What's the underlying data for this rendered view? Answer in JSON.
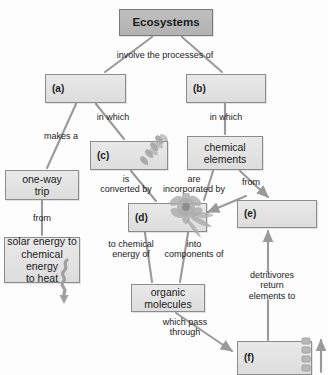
{
  "diagram": {
    "colors": {
      "node_fill": "#e2e2e2",
      "node_fill_dark": "#bfbfbf",
      "node_border": "#8c8c8c",
      "connector": "#9a9a9a",
      "text": "#1b1b1b"
    },
    "nodes": [
      {
        "id": "ecosystems",
        "label": "Ecosystems",
        "style": "dark",
        "x": 119,
        "y": 9,
        "w": 94,
        "h": 27
      },
      {
        "id": "a",
        "label": "(a)",
        "style": "blank",
        "x": 45,
        "y": 74,
        "w": 81,
        "h": 29
      },
      {
        "id": "b",
        "label": "(b)",
        "style": "blank",
        "x": 186,
        "y": 74,
        "w": 80,
        "h": 29
      },
      {
        "id": "c",
        "label": "(c)",
        "style": "blank",
        "x": 90,
        "y": 141,
        "w": 78,
        "h": 29
      },
      {
        "id": "chem",
        "label": "chemical\nelements",
        "style": "plain",
        "x": 187,
        "y": 136,
        "w": 76,
        "h": 34
      },
      {
        "id": "oneway",
        "label": "one-way\ntrip",
        "style": "plain",
        "x": 5,
        "y": 170,
        "w": 74,
        "h": 30
      },
      {
        "id": "d",
        "label": "(d)",
        "style": "blank",
        "x": 128,
        "y": 203,
        "w": 79,
        "h": 29
      },
      {
        "id": "e",
        "label": "(e)",
        "style": "blank",
        "x": 237,
        "y": 200,
        "w": 80,
        "h": 28
      },
      {
        "id": "solar",
        "label": "solar energy to\nchemical energy\nto heat",
        "style": "plain",
        "x": 4,
        "y": 237,
        "w": 76,
        "h": 46
      },
      {
        "id": "organic",
        "label": "organic\nmolecules",
        "style": "plain",
        "x": 131,
        "y": 284,
        "w": 74,
        "h": 28
      },
      {
        "id": "f",
        "label": "(f)",
        "style": "blank",
        "x": 237,
        "y": 341,
        "w": 75,
        "h": 34
      }
    ],
    "edge_labels": [
      {
        "id": "involve",
        "text": "involve the processes of",
        "x": 165,
        "y": 55
      },
      {
        "id": "in-which-left",
        "text": "in which",
        "x": 113,
        "y": 117
      },
      {
        "id": "in-which-right",
        "text": "in which",
        "x": 226,
        "y": 117
      },
      {
        "id": "makes-a",
        "text": "makes a",
        "x": 61,
        "y": 136
      },
      {
        "id": "is-converted",
        "text": "is\nconverted by",
        "x": 126,
        "y": 184
      },
      {
        "id": "are-incorp",
        "text": "are\nincorporated by",
        "x": 194,
        "y": 184
      },
      {
        "id": "from-chem",
        "text": "from",
        "x": 251,
        "y": 182
      },
      {
        "id": "from-left",
        "text": "from",
        "x": 42,
        "y": 218
      },
      {
        "id": "to-chemical",
        "text": "to chemical\nenergy of",
        "x": 131,
        "y": 249
      },
      {
        "id": "into-comp",
        "text": "into\ncomponents of",
        "x": 194,
        "y": 249
      },
      {
        "id": "detritivores",
        "text": "detritivores return\nelements to",
        "x": 272,
        "y": 286
      },
      {
        "id": "which-pass",
        "text": "which pass\nthrough",
        "x": 185,
        "y": 327
      }
    ],
    "illustrations": [
      {
        "id": "plant-sprout-icon",
        "in_node": "c",
        "x": 131,
        "y": 132
      },
      {
        "id": "flower-icon",
        "in_node": "d",
        "x": 172,
        "y": 196
      },
      {
        "id": "heat-squiggle-arrow-icon",
        "x": 63,
        "y": 266
      },
      {
        "id": "detritivore-arrow-icon",
        "x": 313,
        "y": 338
      }
    ]
  }
}
